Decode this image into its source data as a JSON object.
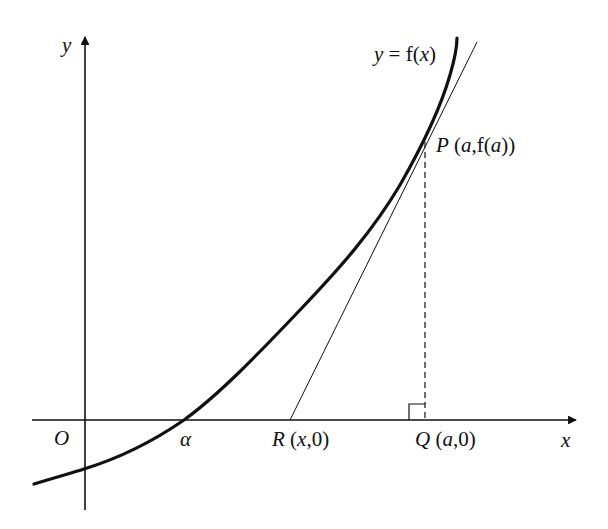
{
  "diagram": {
    "colors": {
      "ink": "#111111",
      "background": "#ffffff"
    },
    "axes": {
      "x_label": "x",
      "y_label": "y",
      "origin_label": "O"
    },
    "curve": {
      "label_prefix": "y = f(",
      "label_var": "x",
      "label_suffix": ")"
    },
    "points": {
      "alpha": {
        "label": "α"
      },
      "R": {
        "name": "R",
        "coords_open": " (",
        "coords_var": "x",
        "coords_close": ",0)"
      },
      "Q": {
        "name": "Q",
        "coords_open": " (",
        "coords_var": "a",
        "coords_close": ",0)"
      },
      "P": {
        "name": "P",
        "coords_open": " (",
        "coords_var": "a",
        "coords_mid": ",f(",
        "coords_var2": "a",
        "coords_close": "))"
      }
    }
  }
}
